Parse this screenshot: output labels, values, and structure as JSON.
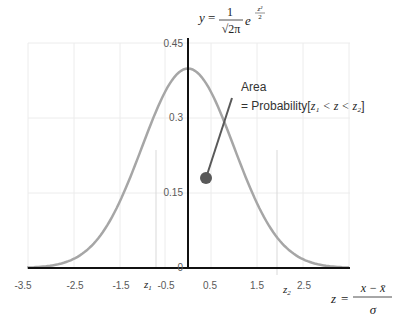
{
  "chart_data": {
    "type": "line",
    "formula": "y = 1/√(2π) · e^(-z²/2)",
    "xlabel": "z = (x − x̄)/σ",
    "ylabel": "y",
    "x_ticks": [
      "-3.5",
      "-2.5",
      "-1.5",
      "-0.5",
      "0.5",
      "1.5",
      "2.5"
    ],
    "y_ticks": [
      "0",
      "0.15",
      "0.3",
      "0.45"
    ],
    "xlim": [
      -3.5,
      3.5
    ],
    "ylim": [
      0,
      0.45
    ],
    "grid": true,
    "series": [
      {
        "name": "pdf",
        "x": [
          -3.5,
          -3.0,
          -2.5,
          -2.0,
          -1.5,
          -1.0,
          -0.5,
          0,
          0.5,
          1.0,
          1.5,
          2.0,
          2.5,
          3.0,
          3.5
        ],
        "y": [
          0.0009,
          0.0044,
          0.0175,
          0.054,
          0.1295,
          0.242,
          0.3521,
          0.3989,
          0.3521,
          0.242,
          0.1295,
          0.054,
          0.0175,
          0.0044,
          0.0009
        ]
      }
    ],
    "markers": {
      "z1": -0.7,
      "z2": 1.85
    },
    "annotations": [
      {
        "text_line1": "Area",
        "text_line2_prefix": "= Probability[",
        "text_line2_math": "z₁ < z < z₂",
        "text_line2_suffix": "]"
      }
    ]
  },
  "labels": {
    "y_eq": "y",
    "eq_sign": "=",
    "one": "1",
    "sqrt2pi": "√2π",
    "e": "e",
    "exp_num": "z²",
    "exp_den": "2",
    "z1": "z",
    "z1_sub": "1",
    "z2": "z",
    "z2_sub": "2",
    "zlabel_z": "z",
    "zlabel_eq": "=",
    "zlabel_num": "x − x̄",
    "zlabel_den": "σ",
    "area": "Area",
    "prob_prefix": "= Probability[",
    "prob_math": "z₁ < z < z₂",
    "prob_suffix": "]",
    "tick_x": [
      "-3.5",
      "-2.5",
      "-1.5",
      "-0.5",
      "0.5",
      "1.5",
      "2.5"
    ],
    "tick_y": [
      "0.45",
      "0.3",
      "0.15",
      "0"
    ]
  },
  "colors": {
    "curve": "#a6a6a6",
    "axis": "#111111",
    "grid": "#ececec",
    "pointer": "#595959"
  }
}
